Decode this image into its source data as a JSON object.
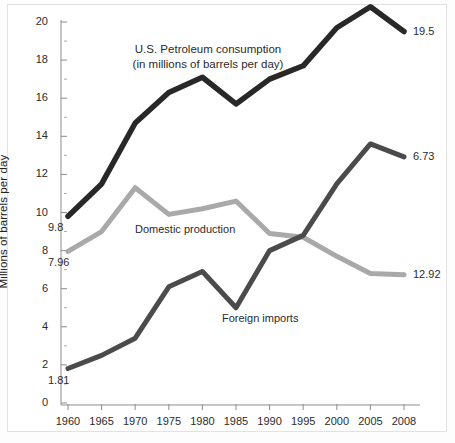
{
  "chart_data": {
    "type": "line",
    "title": "U.S. Petroleum consumption",
    "subtitle": "(in millions of barrels per day)",
    "xlabel": "",
    "ylabel": "Millions of barrels per day",
    "categories": [
      "1960",
      "1965",
      "1970",
      "1975",
      "1980",
      "1985",
      "1990",
      "1995",
      "2000",
      "2005",
      "2008"
    ],
    "x": [
      1960,
      1965,
      1970,
      1975,
      1980,
      1985,
      1990,
      1995,
      2000,
      2005,
      2008
    ],
    "xlim": [
      1960,
      2008
    ],
    "ylim": [
      0,
      20
    ],
    "yticks": [
      "0",
      "2",
      "4",
      "6",
      "8",
      "10",
      "12",
      "14",
      "16",
      "18",
      "20"
    ],
    "grid": false,
    "legend_position": "inline-annotations",
    "series": [
      {
        "name": "U.S. Petroleum consumption",
        "color": "#282828",
        "values": [
          9.8,
          11.5,
          14.7,
          16.3,
          17.1,
          15.7,
          17.0,
          17.7,
          19.7,
          20.8,
          19.5
        ],
        "start_label": "9.8",
        "end_label": "19.5"
      },
      {
        "name": "Domestic production",
        "color": "#a9a9a9",
        "values": [
          7.96,
          9.0,
          11.3,
          9.9,
          10.2,
          10.6,
          8.9,
          8.7,
          7.7,
          6.8,
          6.73
        ],
        "start_label": "7.96",
        "end_label": "6.73"
      },
      {
        "name": "Foreign imports",
        "color": "#4b4b4b",
        "values": [
          1.81,
          2.5,
          3.4,
          6.1,
          6.9,
          5.0,
          8.0,
          8.8,
          11.5,
          13.6,
          12.92
        ],
        "start_label": "1.81",
        "end_label": "12.92"
      }
    ]
  },
  "axis": {
    "ylabel": "Millions of barrels per day",
    "yticks": [
      "20",
      "18",
      "16",
      "14",
      "12",
      "10",
      "8",
      "6",
      "4",
      "2",
      "0"
    ],
    "xticks": [
      "1960",
      "1965",
      "1970",
      "1975",
      "1980",
      "1985",
      "1990",
      "1995",
      "2000",
      "2005",
      "2008"
    ]
  },
  "annotations": {
    "consumption_title_line1": "U.S. Petroleum consumption",
    "consumption_title_line2": "(in millions of barrels per day)",
    "domestic_label": "Domestic production",
    "imports_label": "Foreign imports",
    "start_consumption": "9.8",
    "start_domestic": "7.96",
    "start_imports": "1.81",
    "end_consumption": "19.5",
    "end_domestic": "12.92",
    "end_imports": "6.73"
  },
  "colors": {
    "consumption": "#282828",
    "domestic": "#a9a9a9",
    "imports": "#4b4b4b",
    "axis": "#808080",
    "text": "#2b2b2b",
    "background": "#ffffff"
  }
}
